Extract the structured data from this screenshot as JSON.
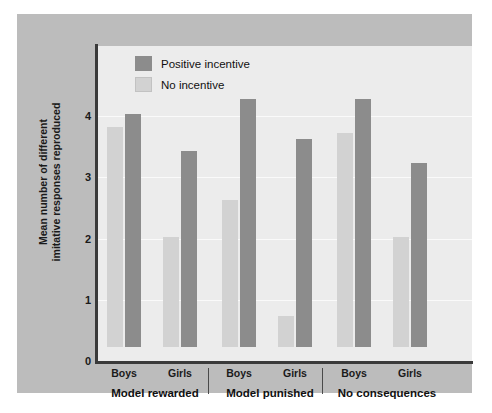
{
  "chart_data": {
    "type": "bar",
    "title": "",
    "xlabel": "",
    "ylabel": "Mean number of different imitative responses reproduced",
    "ylim": [
      0,
      4.3
    ],
    "yticks": [
      0,
      1,
      2,
      3,
      4
    ],
    "ytick_labels": [
      "0",
      "1",
      "2",
      "3",
      "4"
    ],
    "grid": true,
    "legend_position": "top-left",
    "groups": [
      {
        "name": "Model rewarded",
        "subgroups": [
          {
            "name": "Boys",
            "no_incentive": 3.6,
            "positive_incentive": 3.8
          },
          {
            "name": "Girls",
            "no_incentive": 1.8,
            "positive_incentive": 3.2
          }
        ]
      },
      {
        "name": "Model punished",
        "subgroups": [
          {
            "name": "Boys",
            "no_incentive": 2.4,
            "positive_incentive": 4.05
          },
          {
            "name": "Girls",
            "no_incentive": 0.5,
            "positive_incentive": 3.4
          }
        ]
      },
      {
        "name": "No consequences",
        "subgroups": [
          {
            "name": "Boys",
            "no_incentive": 3.5,
            "positive_incentive": 4.05
          },
          {
            "name": "Girls",
            "no_incentive": 1.8,
            "positive_incentive": 3.0
          }
        ]
      }
    ],
    "series": [
      {
        "name": "Positive incentive",
        "color": "#8c8c8c",
        "categories": [
          "Model rewarded / Boys",
          "Model rewarded / Girls",
          "Model punished / Boys",
          "Model punished / Girls",
          "No consequences / Boys",
          "No consequences / Girls"
        ],
        "values": [
          3.8,
          3.2,
          4.05,
          3.4,
          4.05,
          3.0
        ]
      },
      {
        "name": "No incentive",
        "color": "#d2d2d2",
        "categories": [
          "Model rewarded / Boys",
          "Model rewarded / Girls",
          "Model punished / Boys",
          "Model punished / Girls",
          "No consequences / Boys",
          "No consequences / Girls"
        ],
        "values": [
          3.6,
          1.8,
          2.4,
          0.5,
          3.5,
          1.8
        ]
      }
    ]
  },
  "legend": {
    "items": [
      {
        "label": "Positive incentive",
        "swatch": "dark"
      },
      {
        "label": "No incentive",
        "swatch": "light"
      }
    ]
  },
  "axis": {
    "y_label": "Mean number of different imitative responses reproduced",
    "y_label_line1": "Mean number of different",
    "y_label_line2": "imitative responses reproduced",
    "tick_4": "4",
    "tick_3": "3",
    "tick_2": "2",
    "tick_1": "1",
    "tick_0": "0"
  },
  "xaxis": {
    "sublabels": [
      "Boys",
      "Girls",
      "Boys",
      "Girls",
      "Boys",
      "Girls"
    ],
    "grouplabels": [
      "Model rewarded",
      "Model punished",
      "No consequences"
    ]
  },
  "colors": {
    "panel_bg": "#bcbcbc",
    "plot_bg": "#ececec",
    "bar_dark": "#8c8c8c",
    "bar_light": "#d2d2d2",
    "axis": "#3a3a3a",
    "text": "#111111"
  }
}
